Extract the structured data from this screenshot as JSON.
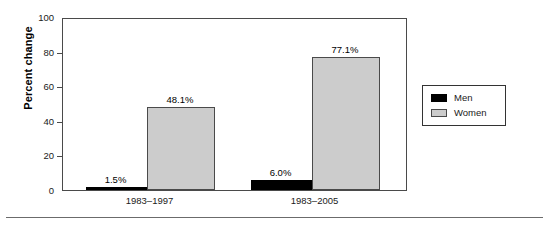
{
  "chart_data": {
    "type": "bar",
    "title": "",
    "subtitle": "",
    "xlabel": "",
    "ylabel": "Percent change",
    "categories": [
      "1983–1997",
      "1983–2005"
    ],
    "series": [
      {
        "name": "Men",
        "values": [
          1.5,
          6.0
        ],
        "labels": [
          "1.5%",
          "6.0%"
        ],
        "color": "#000000"
      },
      {
        "name": "Women",
        "values": [
          48.1,
          77.1
        ],
        "labels": [
          "48.1%",
          "77.1%"
        ],
        "color": "#cccccc"
      }
    ],
    "ylim": [
      0,
      100
    ],
    "yticks": [
      0,
      20,
      40,
      60,
      80,
      100
    ],
    "ytick_labels": [
      "0",
      "20",
      "40",
      "60",
      "80",
      "100"
    ],
    "grid": false,
    "legend_position": "right"
  },
  "legend": {
    "entries": [
      {
        "label": "Men",
        "swatch": "men"
      },
      {
        "label": "Women",
        "swatch": "women"
      }
    ]
  },
  "colors": {
    "men": "#000000",
    "women": "#cccccc",
    "axis": "#4a4a4a",
    "rule": "#6b6b6b"
  }
}
